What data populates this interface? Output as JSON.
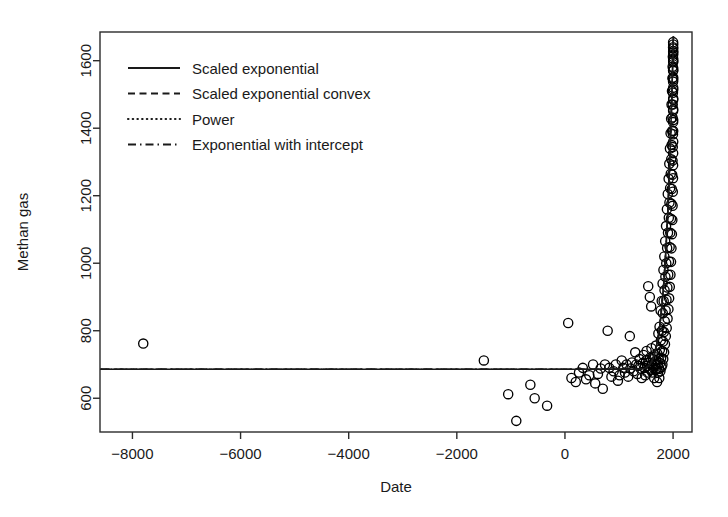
{
  "chart_data": {
    "type": "scatter",
    "title": "",
    "xlabel": "Date",
    "ylabel": "Methan gas",
    "xlim": [
      -8600,
      2350
    ],
    "ylim": [
      500,
      1685
    ],
    "xticks": [
      -8000,
      -6000,
      -4000,
      -2000,
      0,
      2000
    ],
    "xtick_labels": [
      "−8000",
      "−6000",
      "−4000",
      "−2000",
      "0",
      "2000"
    ],
    "yticks": [
      600,
      800,
      1000,
      1200,
      1400,
      1600
    ],
    "ytick_labels": [
      "600",
      "800",
      "1000",
      "1200",
      "1400",
      "1600"
    ],
    "grid": false,
    "point_marker": "open-circle",
    "point_color": "#000000",
    "legend_position": "top-left",
    "legend": [
      {
        "label": "Scaled exponential",
        "style": "solid"
      },
      {
        "label": "Scaled exponential convex",
        "style": "dashed"
      },
      {
        "label": "Power",
        "style": "dotted"
      },
      {
        "label": "Exponential with intercept",
        "style": "dashdot"
      }
    ],
    "series": [
      {
        "name": "Methane observations",
        "marker": "open-circle",
        "points": [
          [
            -7800,
            762
          ],
          [
            -1500,
            712
          ],
          [
            -1050,
            612
          ],
          [
            -900,
            533
          ],
          [
            -640,
            640
          ],
          [
            -560,
            600
          ],
          [
            -330,
            578
          ],
          [
            60,
            823
          ],
          [
            120,
            660
          ],
          [
            200,
            648
          ],
          [
            260,
            676
          ],
          [
            330,
            690
          ],
          [
            390,
            656
          ],
          [
            450,
            668
          ],
          [
            520,
            700
          ],
          [
            560,
            644
          ],
          [
            610,
            672
          ],
          [
            660,
            688
          ],
          [
            700,
            628
          ],
          [
            740,
            700
          ],
          [
            790,
            800
          ],
          [
            820,
            690
          ],
          [
            860,
            664
          ],
          [
            900,
            680
          ],
          [
            940,
            700
          ],
          [
            980,
            652
          ],
          [
            1010,
            668
          ],
          [
            1050,
            712
          ],
          [
            1080,
            690
          ],
          [
            1110,
            676
          ],
          [
            1140,
            700
          ],
          [
            1170,
            664
          ],
          [
            1200,
            784
          ],
          [
            1210,
            688
          ],
          [
            1240,
            706
          ],
          [
            1270,
            680
          ],
          [
            1300,
            736
          ],
          [
            1320,
            700
          ],
          [
            1340,
            672
          ],
          [
            1360,
            696
          ],
          [
            1380,
            716
          ],
          [
            1400,
            688
          ],
          [
            1420,
            660
          ],
          [
            1440,
            704
          ],
          [
            1455,
            728
          ],
          [
            1470,
            690
          ],
          [
            1485,
            668
          ],
          [
            1500,
            712
          ],
          [
            1510,
            740
          ],
          [
            1520,
            696
          ],
          [
            1530,
            676
          ],
          [
            1540,
            932
          ],
          [
            1550,
            704
          ],
          [
            1560,
            688
          ],
          [
            1570,
            900
          ],
          [
            1575,
            720
          ],
          [
            1585,
            684
          ],
          [
            1595,
            872
          ],
          [
            1600,
            748
          ],
          [
            1610,
            700
          ],
          [
            1620,
            676
          ],
          [
            1630,
            716
          ],
          [
            1640,
            690
          ],
          [
            1650,
            660
          ],
          [
            1660,
            728
          ],
          [
            1668,
            700
          ],
          [
            1675,
            684
          ],
          [
            1682,
            756
          ],
          [
            1690,
            712
          ],
          [
            1697,
            688
          ],
          [
            1704,
            648
          ],
          [
            1710,
            732
          ],
          [
            1716,
            700
          ],
          [
            1722,
            676
          ],
          [
            1728,
            792
          ],
          [
            1734,
            716
          ],
          [
            1740,
            688
          ],
          [
            1745,
            660
          ],
          [
            1750,
            812
          ],
          [
            1755,
            744
          ],
          [
            1760,
            704
          ],
          [
            1765,
            680
          ],
          [
            1770,
            860
          ],
          [
            1775,
            772
          ],
          [
            1780,
            720
          ],
          [
            1785,
            692
          ],
          [
            1790,
            888
          ],
          [
            1794,
            800
          ],
          [
            1798,
            740
          ],
          [
            1802,
            700
          ],
          [
            1806,
            940
          ],
          [
            1810,
            852
          ],
          [
            1814,
            768
          ],
          [
            1818,
            716
          ],
          [
            1822,
            980
          ],
          [
            1826,
            888
          ],
          [
            1830,
            796
          ],
          [
            1834,
            736
          ],
          [
            1838,
            1020
          ],
          [
            1842,
            920
          ],
          [
            1846,
            828
          ],
          [
            1850,
            760
          ],
          [
            1854,
            1065
          ],
          [
            1858,
            960
          ],
          [
            1862,
            860
          ],
          [
            1866,
            784
          ],
          [
            1870,
            1110
          ],
          [
            1874,
            1000
          ],
          [
            1878,
            892
          ],
          [
            1882,
            808
          ],
          [
            1886,
            1160
          ],
          [
            1890,
            1045
          ],
          [
            1894,
            928
          ],
          [
            1898,
            836
          ],
          [
            1902,
            1205
          ],
          [
            1906,
            1090
          ],
          [
            1910,
            966
          ],
          [
            1914,
            864
          ],
          [
            1918,
            1250
          ],
          [
            1921,
            1135
          ],
          [
            1924,
            1005
          ],
          [
            1927,
            896
          ],
          [
            1930,
            1295
          ],
          [
            1933,
            1180
          ],
          [
            1936,
            1048
          ],
          [
            1939,
            930
          ],
          [
            1942,
            1340
          ],
          [
            1945,
            1222
          ],
          [
            1948,
            1090
          ],
          [
            1951,
            966
          ],
          [
            1954,
            1385
          ],
          [
            1957,
            1265
          ],
          [
            1960,
            1132
          ],
          [
            1962,
            1004
          ],
          [
            1964,
            1428
          ],
          [
            1966,
            1308
          ],
          [
            1968,
            1176
          ],
          [
            1970,
            1044
          ],
          [
            1972,
            1470
          ],
          [
            1974,
            1350
          ],
          [
            1976,
            1220
          ],
          [
            1978,
            1086
          ],
          [
            1980,
            1510
          ],
          [
            1982,
            1392
          ],
          [
            1984,
            1262
          ],
          [
            1986,
            1128
          ],
          [
            1988,
            1548
          ],
          [
            1989,
            1432
          ],
          [
            1990,
            1304
          ],
          [
            1991,
            1170
          ],
          [
            1992,
            1582
          ],
          [
            1993,
            1470
          ],
          [
            1994,
            1344
          ],
          [
            1995,
            1212
          ],
          [
            1996,
            1612
          ],
          [
            1997,
            1505
          ],
          [
            1998,
            1382
          ],
          [
            1999,
            1252
          ],
          [
            2000,
            1640
          ],
          [
            2000,
            1538
          ],
          [
            2000,
            1418
          ],
          [
            2000,
            1290
          ],
          [
            2001,
            1655
          ],
          [
            2001,
            1570
          ],
          [
            2001,
            1452
          ],
          [
            2001,
            1326
          ],
          [
            2002,
            1600
          ],
          [
            2002,
            1484
          ],
          [
            2002,
            1360
          ],
          [
            2002,
            1628
          ],
          [
            2002,
            1514
          ],
          [
            2002,
            1392
          ],
          [
            2002,
            1544
          ],
          [
            2002,
            1424
          ],
          [
            2002,
            1572
          ],
          [
            2002,
            1456
          ],
          [
            2002,
            1596
          ],
          [
            2002,
            1488
          ],
          [
            2002,
            1618
          ],
          [
            2002,
            1520
          ],
          [
            2002,
            1636
          ],
          [
            2002,
            1550
          ],
          [
            2002,
            1648
          ],
          [
            2002,
            1578
          ],
          [
            2002,
            1606
          ],
          [
            2002,
            1624
          ]
        ]
      }
    ],
    "fits": [
      {
        "name": "Scaled exponential",
        "style": "solid",
        "description": "Flat near 686 from -8600 until about year 1400, then rises steeply to ~1650 by year 2002"
      }
    ]
  }
}
